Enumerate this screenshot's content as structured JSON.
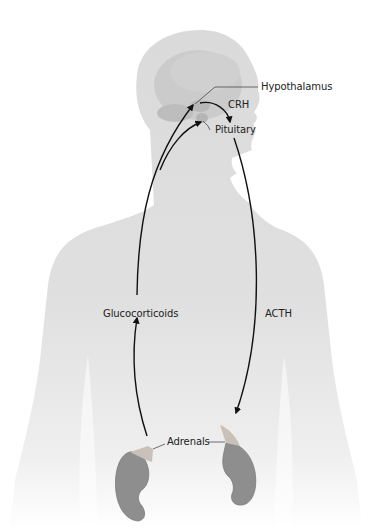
{
  "diagram": {
    "labels": {
      "hypothalamus": "Hypothalamus",
      "crh": "CRH",
      "pituitary": "Pituitary",
      "glucocorticoids": "Glucocorticoids",
      "acth": "ACTH",
      "adrenals": "Adrenals"
    },
    "colors": {
      "body": "#dcdcdc",
      "brain": "#c9c9c9",
      "kidney": "#8e8e8e",
      "adrenal": "#c8c0b8",
      "arrow": "#111111"
    }
  }
}
